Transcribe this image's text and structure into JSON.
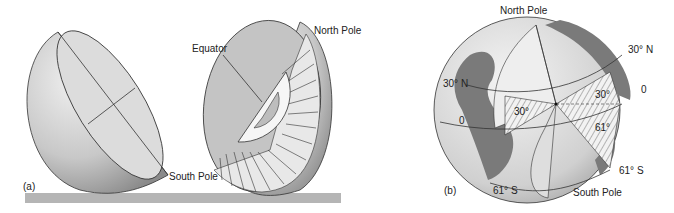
{
  "figure": {
    "panel_a": {
      "label": "(a)",
      "annotations": {
        "equator": "Equator",
        "north_pole": "North Pole",
        "south_pole": "South Pole"
      }
    },
    "panel_b": {
      "label": "(b)",
      "annotations": {
        "north_pole": "North Pole",
        "south_pole": "South Pole",
        "lat_30n_left": "30° N",
        "lat_30n_right": "30° N",
        "zero_left": "0",
        "zero_right": "0",
        "lat_61s_bottom": "61° S",
        "lat_61s_right": "61° S",
        "angle_30_left": "30°",
        "angle_30_right": "30°",
        "angle_61": "61°"
      }
    }
  },
  "colors": {
    "sphere_fill": "#c8c8c8",
    "land": "#7a7a7a",
    "base_bar": "#b5b5b5",
    "line": "#333333"
  }
}
